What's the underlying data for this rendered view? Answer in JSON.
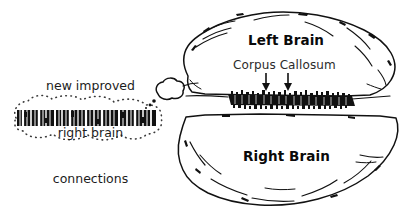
{
  "figure": {
    "background_color": "#ffffff",
    "ink_color": "#111111",
    "label_color": "#0a0a0a",
    "secondary_label_color": "#2b2b2b"
  },
  "callout": {
    "caption_line_1": "new improved",
    "caption_line_2": "right brain",
    "caption_line_3": "connections",
    "bubble_style": "dotted-cloud",
    "content_name": "barcode-band",
    "content_description": "black barcode band"
  },
  "brain": {
    "left_hemisphere_label": "Left Brain",
    "right_hemisphere_label": "Right Brain",
    "corpus_callosum_label": "Corpus Callosum",
    "arrow_count": 2
  }
}
